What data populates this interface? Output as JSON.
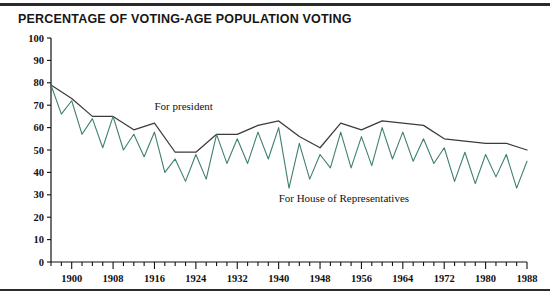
{
  "figure": {
    "title": "PERCENTAGE OF VOTING-AGE POPULATION VOTING",
    "has_top_rule": true,
    "has_bottom_rule": true
  },
  "chart_data": {
    "type": "line",
    "title": "PERCENTAGE OF VOTING-AGE POPULATION VOTING",
    "xlabel": "",
    "ylabel": "",
    "xlim": [
      1896,
      1988
    ],
    "ylim": [
      0,
      100
    ],
    "yticks": [
      0,
      10,
      20,
      30,
      40,
      50,
      60,
      70,
      80,
      90,
      100
    ],
    "ytick_labels": [
      "0",
      "10",
      "20",
      "30",
      "40",
      "50",
      "60",
      "70",
      "80",
      "90",
      "100"
    ],
    "xticks": [
      1900,
      1908,
      1916,
      1924,
      1932,
      1940,
      1948,
      1956,
      1964,
      1972,
      1980,
      1988
    ],
    "xtick_labels": [
      "1900",
      "1908",
      "1916",
      "1924",
      "1932",
      "1940",
      "1948",
      "1956",
      "1964",
      "1972",
      "1980",
      "1988"
    ],
    "minor_xtick_interval": 2,
    "grid": false,
    "legend_position": "inline-annotations",
    "colors": {
      "president": "#3b3b3b",
      "house": "#3f7f72"
    },
    "annotations": [
      {
        "text": "For president",
        "x": 1916,
        "y": 68,
        "name": "president-label"
      },
      {
        "text": "For House of Representatives",
        "x": 1940,
        "y": 27,
        "name": "house-label"
      }
    ],
    "series": [
      {
        "name": "For president",
        "color": "#3b3b3b",
        "x": [
          1896,
          1900,
          1904,
          1908,
          1912,
          1916,
          1920,
          1924,
          1928,
          1932,
          1936,
          1940,
          1944,
          1948,
          1952,
          1956,
          1960,
          1964,
          1968,
          1972,
          1976,
          1980,
          1984,
          1988
        ],
        "values": [
          79,
          73,
          65,
          65,
          59,
          62,
          49,
          49,
          57,
          57,
          61,
          63,
          56,
          51,
          62,
          59,
          63,
          62,
          61,
          55,
          54,
          53,
          53,
          50
        ]
      },
      {
        "name": "For House of Representatives",
        "color": "#3f7f72",
        "x": [
          1896,
          1898,
          1900,
          1902,
          1904,
          1906,
          1908,
          1910,
          1912,
          1914,
          1916,
          1918,
          1920,
          1922,
          1924,
          1926,
          1928,
          1930,
          1932,
          1934,
          1936,
          1938,
          1940,
          1942,
          1944,
          1946,
          1948,
          1950,
          1952,
          1954,
          1956,
          1958,
          1960,
          1962,
          1964,
          1966,
          1968,
          1970,
          1972,
          1974,
          1976,
          1978,
          1980,
          1982,
          1984,
          1986,
          1988
        ],
        "values": [
          79,
          66,
          72,
          57,
          64,
          51,
          65,
          50,
          57,
          47,
          58,
          40,
          46,
          36,
          48,
          37,
          57,
          44,
          55,
          44,
          58,
          46,
          60,
          33,
          53,
          37,
          48,
          42,
          58,
          42,
          56,
          43,
          60,
          46,
          58,
          45,
          55,
          44,
          51,
          36,
          49,
          35,
          48,
          38,
          48,
          33,
          45
        ]
      }
    ]
  }
}
